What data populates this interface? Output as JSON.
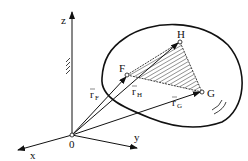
{
  "diagram": {
    "type": "rigid-body-kinematics",
    "axes": {
      "z": "z",
      "x": "x",
      "y": "y",
      "origin": "0"
    },
    "points": {
      "F": "F",
      "H": "H",
      "G": "G"
    },
    "vectors": {
      "rF": {
        "base": "r",
        "sub": "F"
      },
      "rH": {
        "base": "r",
        "sub": "H"
      },
      "rG": {
        "base": "r",
        "sub": "G"
      }
    },
    "colors": {
      "stroke": "#111111",
      "background": "#ffffff"
    }
  }
}
